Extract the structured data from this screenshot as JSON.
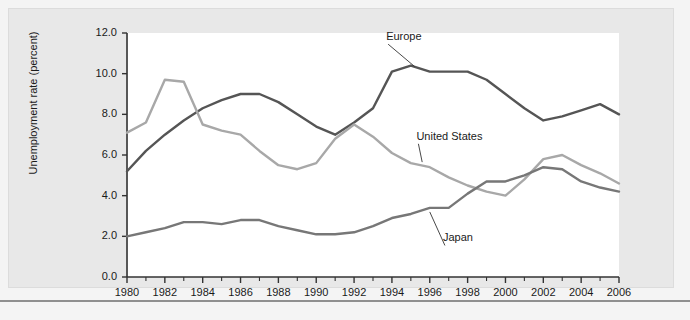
{
  "chart_data": {
    "type": "line",
    "title": "",
    "xlabel": "",
    "ylabel": "Unemployment rate (percent)",
    "xlim": [
      1980,
      2006
    ],
    "ylim": [
      0.0,
      12.0
    ],
    "grid": false,
    "legend_position": "inline-annotations",
    "x": [
      1980,
      1981,
      1982,
      1983,
      1984,
      1985,
      1986,
      1987,
      1988,
      1989,
      1990,
      1991,
      1992,
      1993,
      1994,
      1995,
      1996,
      1997,
      1998,
      1999,
      2000,
      2001,
      2002,
      2003,
      2004,
      2005,
      2006
    ],
    "y_ticks": [
      "0.0",
      "2.0",
      "4.0",
      "6.0",
      "8.0",
      "10.0",
      "12.0"
    ],
    "x_ticks": [
      "1980",
      "1982",
      "1984",
      "1986",
      "1988",
      "1990",
      "1992",
      "1994",
      "1996",
      "1998",
      "2000",
      "2002",
      "2004",
      "2006"
    ],
    "series": [
      {
        "name": "Europe",
        "color": "#555555",
        "values": [
          5.2,
          6.2,
          7.0,
          7.7,
          8.3,
          8.7,
          9.0,
          9.0,
          8.6,
          8.0,
          7.4,
          7.0,
          7.6,
          8.3,
          10.1,
          10.4,
          10.1,
          10.1,
          10.1,
          9.7,
          9.0,
          8.3,
          7.7,
          7.9,
          8.2,
          8.5,
          8.0
        ]
      },
      {
        "name": "United States",
        "color": "#a8a8a8",
        "values": [
          7.1,
          7.6,
          9.7,
          9.6,
          7.5,
          7.2,
          7.0,
          6.2,
          5.5,
          5.3,
          5.6,
          6.8,
          7.5,
          6.9,
          6.1,
          5.6,
          5.4,
          4.9,
          4.5,
          4.2,
          4.0,
          4.8,
          5.8,
          6.0,
          5.5,
          5.1,
          4.6
        ]
      },
      {
        "name": "Japan",
        "color": "#777777",
        "values": [
          2.0,
          2.2,
          2.4,
          2.7,
          2.7,
          2.6,
          2.8,
          2.8,
          2.5,
          2.3,
          2.1,
          2.1,
          2.2,
          2.5,
          2.9,
          3.1,
          3.4,
          3.4,
          4.1,
          4.7,
          4.7,
          5.0,
          5.4,
          5.3,
          4.7,
          4.4,
          4.2
        ]
      }
    ],
    "annotations": [
      {
        "text": "Europe",
        "x": 1993.8,
        "y": 11.45,
        "leader_to_x": 1995.2,
        "leader_to_y": 10.35
      },
      {
        "text": "United States",
        "x": 1995.4,
        "y": 6.55,
        "leader_to_x": 1995.6,
        "leader_to_y": 5.65
      },
      {
        "text": "Japan",
        "x": 1996.8,
        "y": 1.55,
        "leader_to_x": 1996.0,
        "leader_to_y": 3.2
      }
    ]
  }
}
